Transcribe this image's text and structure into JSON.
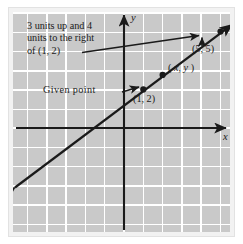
{
  "figure": {
    "background_color": "#c9c9c9",
    "grid_color": "#ffffff",
    "ink_color": "#1a1a1a",
    "plate_color": "#f2f2f2"
  },
  "annotations": {
    "callout_line1": "3 units up and 4",
    "callout_line2": "units to the right",
    "callout_line3": "of (1, 2)",
    "given_point": "Given point",
    "point1_label": "(1, 2)",
    "point2_label": "(5, 5)",
    "generic_point_open": "( ",
    "generic_point_x": "x",
    "generic_point_comma": ", ",
    "generic_point_y": "y",
    "generic_point_close": " )"
  },
  "axes": {
    "x_label": "x",
    "y_label": "y"
  },
  "chart_data": {
    "type": "line",
    "xlabel": "x",
    "ylabel": "y",
    "xlim": [
      -6,
      5.4
    ],
    "ylim": [
      -5,
      6.1
    ],
    "grid": true,
    "grid_spacing": 1,
    "legend": "none",
    "series": [
      {
        "name": "line through (1,2) and (5,5)",
        "slope": 0.75,
        "intercept": 1.25,
        "x": [
          -5.8,
          5.2
        ],
        "y": [
          -3.1,
          5.15
        ]
      }
    ],
    "points": [
      {
        "label": "(1, 2)",
        "x": 1,
        "y": 2
      },
      {
        "label": "( x, y )",
        "x": 2,
        "y": 2.75
      },
      {
        "label": "(5, 5)",
        "x": 5,
        "y": 5
      }
    ],
    "annotations": [
      {
        "text": "3 units up and 4 units to the right of (1, 2)",
        "points_to": "(5, 5)"
      },
      {
        "text": "Given point",
        "points_to": "(1, 2)"
      }
    ]
  }
}
